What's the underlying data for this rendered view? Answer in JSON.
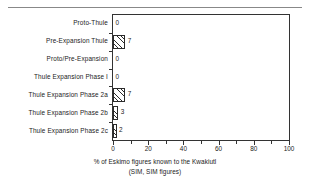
{
  "chart_data": {
    "type": "bar",
    "orientation": "horizontal",
    "title": "",
    "xlabel": "% of Eskimo figures known to the Kwakiutl",
    "xlabel_line2": "(SIM, SIM  figures)",
    "ylabel": "",
    "xlim": [
      0,
      100
    ],
    "grid": false,
    "legend": null,
    "xticks_major": [
      0,
      20,
      40,
      60,
      80,
      100
    ],
    "xticks_minor": [
      10,
      30,
      50,
      70,
      90
    ],
    "xtick_labels": [
      "0",
      "20",
      "40",
      "60",
      "80",
      "100"
    ],
    "categories": [
      "Proto-Thule",
      "Pre-Expansion Thule",
      "Proto/Pre-Expansion",
      "Thule Expansion Phase I",
      "Thule Expansion Phase 2a",
      "Thule Expansion Phase 2b",
      "Thule Expansion Phase 2c"
    ],
    "values": [
      0,
      7,
      0,
      0,
      7,
      3,
      2
    ],
    "value_labels": [
      "0",
      "7",
      "0",
      "0",
      "7",
      "3",
      "2"
    ],
    "bar_fill": "diagonal-hatch",
    "bar_edge_color": "#2b2b2b",
    "axis_color": "#333333",
    "background_color": "#ffffff"
  },
  "decor": {
    "top_rule": "horizontal-rule"
  }
}
